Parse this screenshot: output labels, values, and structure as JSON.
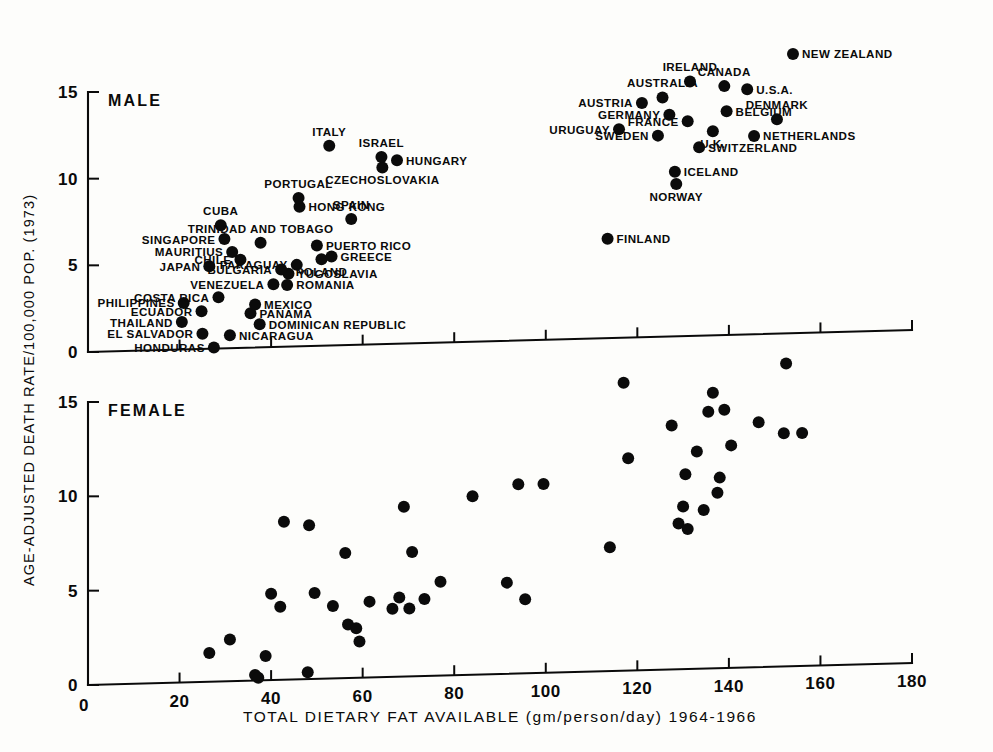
{
  "figure": {
    "y_axis_title": "AGE-ADJUSTED DEATH RATE/100,000 POP. (1973)",
    "x_axis_title": "TOTAL DIETARY FAT AVAILABLE (gm/person/day) 1964-1966",
    "panel_male_title": "MALE",
    "panel_female_title": "FEMALE"
  },
  "chart_data": {
    "type": "scatter",
    "title": "",
    "xlabel": "TOTAL DIETARY FAT AVAILABLE (gm/person/day) 1964-1966",
    "ylabel": "AGE-ADJUSTED DEATH RATE/100,000 POP. (1973)",
    "xlim": [
      0,
      180
    ],
    "ylim": [
      0,
      15
    ],
    "grid": false,
    "legend_position": "none",
    "x_ticks": [
      0,
      20,
      40,
      60,
      80,
      100,
      120,
      140,
      160,
      180
    ],
    "y_ticks": [
      0,
      5,
      10,
      15
    ],
    "panels": [
      {
        "name": "MALE",
        "x_tick_labels_shown": false,
        "points": [
          {
            "label": "HONDURAS",
            "x": 27.5,
            "y": 0.15,
            "label_side": "left"
          },
          {
            "label": "EL SALVADOR",
            "x": 25.0,
            "y": 0.95,
            "label_side": "left"
          },
          {
            "label": "NICARAGUA",
            "x": 31.0,
            "y": 0.85,
            "label_side": "right"
          },
          {
            "label": "THAILAND",
            "x": 20.5,
            "y": 1.65,
            "label_side": "left"
          },
          {
            "label": "DOMINICAN REPUBLIC",
            "x": 37.5,
            "y": 1.45,
            "label_side": "right"
          },
          {
            "label": "PANAMA",
            "x": 35.5,
            "y": 2.1,
            "label_side": "right"
          },
          {
            "label": "PHILIPPINES",
            "x": 20.9,
            "y": 2.75,
            "label_side": "left"
          },
          {
            "label": "ECUADOR",
            "x": 24.8,
            "y": 2.25,
            "label_side": "left"
          },
          {
            "label": "MEXICO",
            "x": 36.5,
            "y": 2.6,
            "label_side": "right"
          },
          {
            "label": "COSTA RICA",
            "x": 28.5,
            "y": 3.05,
            "label_side": "left"
          },
          {
            "label": "ROMANIA",
            "x": 43.5,
            "y": 3.7,
            "label_side": "right"
          },
          {
            "label": "VENEZUELA",
            "x": 40.5,
            "y": 3.75,
            "label_side": "left"
          },
          {
            "label": "YUGOSLAVIA",
            "x": 43.8,
            "y": 4.35,
            "label_side": "right"
          },
          {
            "label": "JAPAN",
            "x": 26.5,
            "y": 4.85,
            "label_side": "left"
          },
          {
            "label": "CHILE",
            "x": 33.3,
            "y": 5.2,
            "label_side": "left"
          },
          {
            "label": "BULGARIA",
            "x": 42.2,
            "y": 4.6,
            "label_side": "left"
          },
          {
            "label": "PARAGUAY",
            "x": 45.6,
            "y": 4.85,
            "label_side": "left"
          },
          {
            "label": "POLAND",
            "x": 51.0,
            "y": 5.15,
            "label_side": "below"
          },
          {
            "label": "GREECE",
            "x": 53.2,
            "y": 5.3,
            "label_side": "right"
          },
          {
            "label": "MAURITIUS",
            "x": 31.5,
            "y": 5.65,
            "label_side": "left"
          },
          {
            "label": "PUERTO RICO",
            "x": 50.0,
            "y": 5.95,
            "label_side": "right"
          },
          {
            "label": "SINGAPORE",
            "x": 29.8,
            "y": 6.4,
            "label_side": "left"
          },
          {
            "label": "TRINIDAD AND TOBAGO",
            "x": 37.7,
            "y": 6.15,
            "label_side": "above"
          },
          {
            "label": "CUBA",
            "x": 29.0,
            "y": 7.2,
            "label_side": "above"
          },
          {
            "label": "SPAIN",
            "x": 57.5,
            "y": 7.45,
            "label_side": "above"
          },
          {
            "label": "HONG KONG",
            "x": 46.2,
            "y": 8.2,
            "label_side": "right"
          },
          {
            "label": "PORTUGAL",
            "x": 46.0,
            "y": 8.7,
            "label_side": "above"
          },
          {
            "label": "NORWAY",
            "x": 128.5,
            "y": 9.2,
            "label_side": "below"
          },
          {
            "label": "ICELAND",
            "x": 128.2,
            "y": 9.9,
            "label_side": "right"
          },
          {
            "label": "CZECHOSLOVAKIA",
            "x": 64.3,
            "y": 10.4,
            "label_side": "below"
          },
          {
            "label": "HUNGARY",
            "x": 67.5,
            "y": 10.8,
            "label_side": "right"
          },
          {
            "label": "ISRAEL",
            "x": 64.1,
            "y": 11.0,
            "label_side": "above"
          },
          {
            "label": "FINLAND",
            "x": 113.5,
            "y": 6.1,
            "label_side": "right"
          },
          {
            "label": "ITALY",
            "x": 52.7,
            "y": 11.7,
            "label_side": "above"
          },
          {
            "label": "SWITZERLAND",
            "x": 133.5,
            "y": 11.3,
            "label_side": "right"
          },
          {
            "label": "SWEDEN",
            "x": 124.5,
            "y": 12.0,
            "label_side": "left"
          },
          {
            "label": "NETHERLANDS",
            "x": 145.5,
            "y": 11.9,
            "label_side": "right"
          },
          {
            "label": "U.K.",
            "x": 136.5,
            "y": 12.2,
            "label_side": "below"
          },
          {
            "label": "URUGUAY",
            "x": 116.0,
            "y": 12.4,
            "label_side": "left"
          },
          {
            "label": "FRANCE",
            "x": 131.0,
            "y": 12.8,
            "label_side": "left"
          },
          {
            "label": "DENMARK",
            "x": 150.5,
            "y": 12.85,
            "label_side": "above"
          },
          {
            "label": "GERMANY",
            "x": 127.0,
            "y": 13.2,
            "label_side": "left"
          },
          {
            "label": "BELGIUM",
            "x": 139.5,
            "y": 13.35,
            "label_side": "right"
          },
          {
            "label": "AUSTRIA",
            "x": 121.0,
            "y": 13.9,
            "label_side": "left"
          },
          {
            "label": "AUSTRALIA",
            "x": 125.5,
            "y": 14.2,
            "label_side": "above"
          },
          {
            "label": "U.S.A.",
            "x": 144.0,
            "y": 14.6,
            "label_side": "right"
          },
          {
            "label": "CANADA",
            "x": 139.0,
            "y": 14.8,
            "label_side": "above"
          },
          {
            "label": "IRELAND",
            "x": 131.5,
            "y": 15.1,
            "label_side": "above"
          },
          {
            "label": "NEW ZEALAND",
            "x": 154.0,
            "y": 16.6,
            "label_side": "right"
          }
        ]
      },
      {
        "name": "FEMALE",
        "x_tick_labels_shown": true,
        "points": [
          {
            "x": 26.5,
            "y": 1.6
          },
          {
            "x": 31.0,
            "y": 2.3
          },
          {
            "x": 36.5,
            "y": 0.4
          },
          {
            "x": 37.2,
            "y": 0.25
          },
          {
            "x": 38.8,
            "y": 1.4
          },
          {
            "x": 40.0,
            "y": 4.7
          },
          {
            "x": 42.0,
            "y": 4.0
          },
          {
            "x": 42.8,
            "y": 8.5
          },
          {
            "x": 48.0,
            "y": 0.5
          },
          {
            "x": 48.3,
            "y": 8.3
          },
          {
            "x": 49.5,
            "y": 4.7
          },
          {
            "x": 53.5,
            "y": 4.0
          },
          {
            "x": 56.2,
            "y": 6.8
          },
          {
            "x": 56.8,
            "y": 3.0
          },
          {
            "x": 58.6,
            "y": 2.8
          },
          {
            "x": 59.3,
            "y": 2.1
          },
          {
            "x": 61.5,
            "y": 4.2
          },
          {
            "x": 66.5,
            "y": 3.8
          },
          {
            "x": 68.0,
            "y": 4.4
          },
          {
            "x": 69.0,
            "y": 9.2
          },
          {
            "x": 70.2,
            "y": 3.8
          },
          {
            "x": 70.8,
            "y": 6.8
          },
          {
            "x": 73.5,
            "y": 4.3
          },
          {
            "x": 77.0,
            "y": 5.2
          },
          {
            "x": 84.0,
            "y": 9.7
          },
          {
            "x": 91.5,
            "y": 5.1
          },
          {
            "x": 94.0,
            "y": 10.3
          },
          {
            "x": 95.5,
            "y": 4.2
          },
          {
            "x": 99.5,
            "y": 10.3
          },
          {
            "x": 114.0,
            "y": 6.9
          },
          {
            "x": 117.0,
            "y": 15.6
          },
          {
            "x": 118.0,
            "y": 11.6
          },
          {
            "x": 127.5,
            "y": 13.3
          },
          {
            "x": 129.0,
            "y": 8.1
          },
          {
            "x": 130.0,
            "y": 9.0
          },
          {
            "x": 130.5,
            "y": 10.7
          },
          {
            "x": 131.0,
            "y": 7.8
          },
          {
            "x": 133.0,
            "y": 11.9
          },
          {
            "x": 134.5,
            "y": 8.8
          },
          {
            "x": 135.5,
            "y": 14.0
          },
          {
            "x": 136.5,
            "y": 15.0
          },
          {
            "x": 137.5,
            "y": 9.7
          },
          {
            "x": 138.0,
            "y": 10.5
          },
          {
            "x": 139.0,
            "y": 14.1
          },
          {
            "x": 140.5,
            "y": 12.2
          },
          {
            "x": 146.5,
            "y": 13.4
          },
          {
            "x": 152.5,
            "y": 16.5
          },
          {
            "x": 152.0,
            "y": 12.8
          },
          {
            "x": 156.0,
            "y": 12.8
          }
        ]
      }
    ]
  }
}
